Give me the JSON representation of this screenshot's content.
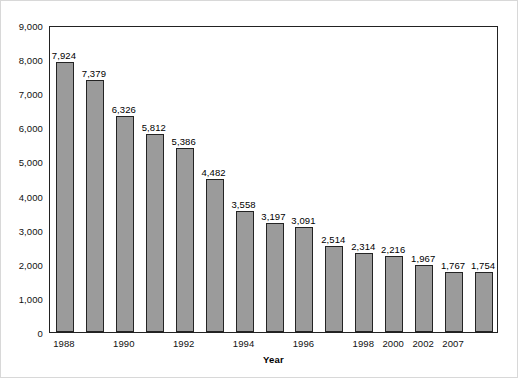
{
  "chart_data": {
    "type": "bar",
    "title": "",
    "subtitle": "",
    "xlabel": "Year",
    "ylabel": "",
    "categories": [
      "1988",
      "1989",
      "1990",
      "1991",
      "1992",
      "1993",
      "1994",
      "1995",
      "1996",
      "1997",
      "1998",
      "2000",
      "2002",
      "2007"
    ],
    "values": [
      7924,
      7379,
      6326,
      5812,
      5386,
      4482,
      3558,
      3197,
      3091,
      2514,
      2314,
      2216,
      1967,
      1767
    ],
    "data_labels": [
      "7,924",
      "7,379",
      "6,326",
      "5,812",
      "5,386",
      "4,482",
      "3,558",
      "3,197",
      "3,091",
      "2,514",
      "2,314",
      "2,216",
      "1,967",
      "1,767"
    ],
    "bar_count": 14,
    "ylim": [
      0,
      9000
    ],
    "ytick_values": [
      0,
      1000,
      2000,
      3000,
      4000,
      5000,
      6000,
      7000,
      8000,
      9000
    ],
    "ytick_labels": [
      "0",
      "1,000",
      "2,000",
      "3,000",
      "4,000",
      "5,000",
      "6,000",
      "7,000",
      "8,000",
      "9,000"
    ],
    "xtick_labels": [
      "1988",
      "1990",
      "1992",
      "1994",
      "1996",
      "1998",
      "2000",
      "2002",
      "2007"
    ],
    "xtick_bar_indices": [
      0,
      2,
      4,
      6,
      8,
      10,
      11,
      12,
      13
    ],
    "grid": false,
    "legend": false,
    "legend_position": "none",
    "bar_color": "#9b9b9b",
    "bar_border_color": "#242424",
    "axis_color": "#222222",
    "text_color": "#111111",
    "background_color": "#ffffff"
  },
  "bars": [
    {
      "label": "7,924",
      "value": 7924,
      "year": "1988"
    },
    {
      "label": "7,379",
      "value": 7379,
      "year": "1989"
    },
    {
      "label": "6,326",
      "value": 6326,
      "year": "1990"
    },
    {
      "label": "5,812",
      "value": 5812,
      "year": "1991"
    },
    {
      "label": "5,386",
      "value": 5386,
      "year": "1992"
    },
    {
      "label": "4,482",
      "value": 4482,
      "year": "1993"
    },
    {
      "label": "3,558",
      "value": 3558,
      "year": "1994"
    },
    {
      "label": "3,197",
      "value": 3197,
      "year": "1995"
    },
    {
      "label": "3,091",
      "value": 3091,
      "year": "1996"
    },
    {
      "label": "2,514",
      "value": 2514,
      "year": "1997"
    },
    {
      "label": "2,314",
      "value": 2314,
      "year": "1998"
    },
    {
      "label": "2,216",
      "value": 2216,
      "year": "2000"
    },
    {
      "label": "1,967",
      "value": 1967,
      "year": "2002"
    },
    {
      "label": "1,767",
      "value": 1767,
      "year": "2007"
    }
  ],
  "extra_bar": {
    "label": "1,754",
    "value": 1754
  }
}
